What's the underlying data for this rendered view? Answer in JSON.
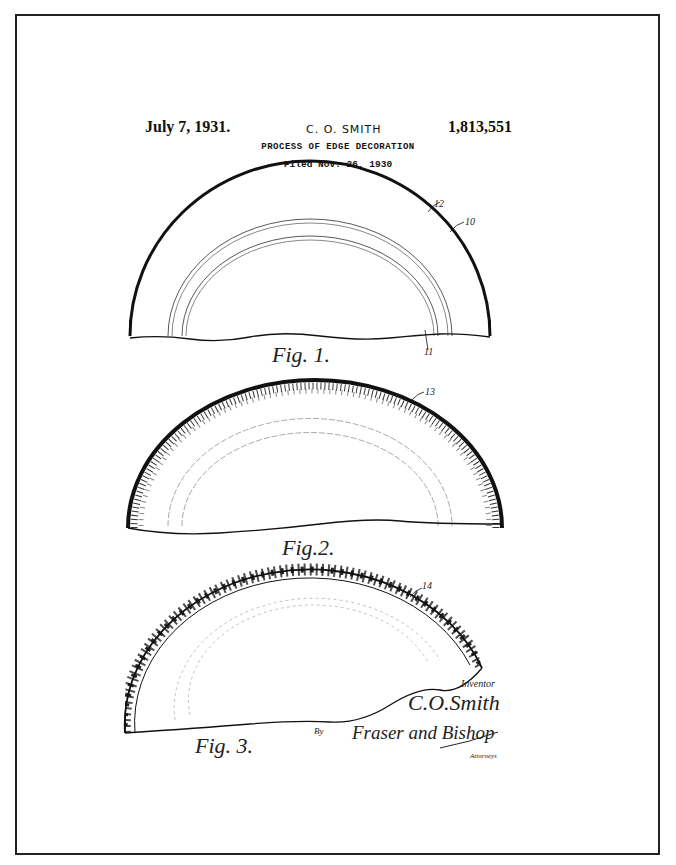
{
  "header": {
    "date": "July 7, 1931.",
    "inventor": "C. O. SMITH",
    "patent_number": "1,813,551",
    "title": "PROCESS OF EDGE DECORATION",
    "filed": "Filed Nov. 26, 1930"
  },
  "figures": [
    {
      "label": "Fig. 1.",
      "refs": [
        "12",
        "10",
        "11"
      ]
    },
    {
      "label": "Fig.2.",
      "refs": [
        "13"
      ]
    },
    {
      "label": "Fig. 3.",
      "refs": [
        "14"
      ]
    }
  ],
  "signature": {
    "inventor_caption": "Inventor",
    "inventor_name": "C.O.Smith",
    "by": "By",
    "attorneys_name": "Fraser and Bishop",
    "attorneys_caption": "Attorneys"
  },
  "colors": {
    "ink": "#111111",
    "paper": "#ffffff"
  }
}
